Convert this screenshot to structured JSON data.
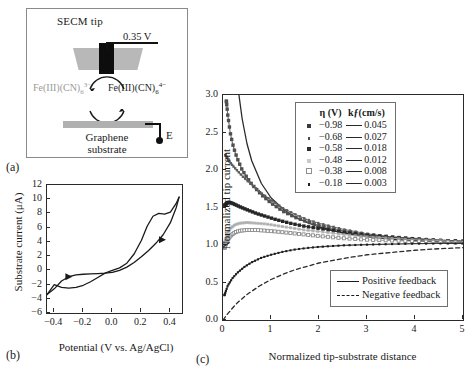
{
  "figure": {
    "panels": [
      {
        "id": "a",
        "label": "(a)"
      },
      {
        "id": "b",
        "label": "(b)"
      },
      {
        "id": "c",
        "label": "(c)"
      }
    ]
  },
  "panel_a": {
    "label": "(a)",
    "tip_title": "SECM tip",
    "tip_potential": "0.35 V",
    "species_left_main": "Fe(III)(CN)",
    "species_left_sub": "6",
    "species_left_sup": "3−",
    "species_right_main": "Fe(III)(CN)",
    "species_right_sub": "6",
    "species_right_sup": "4−",
    "electrode_label": "E",
    "substrate_line1": "Graphene",
    "substrate_line2": "substrate",
    "colors": {
      "tip_body": "#b8b8b8",
      "electrode": "#0d0d0d",
      "substrate": "#b0b0b0",
      "species_left_text": "#9a9a9a"
    }
  },
  "chart_data": [
    {
      "type": "line",
      "panel": "b",
      "title": "",
      "xlabel": "Potential (V vs. Ag/AgCl)",
      "ylabel": "Substrate current (μA)",
      "xlim": [
        -0.45,
        0.48
      ],
      "ylim": [
        -6,
        12
      ],
      "xticks": [
        -0.4,
        -0.2,
        0.0,
        0.2,
        0.4
      ],
      "xticklabels": [
        "−0.4",
        "−0.2",
        "0.0",
        "0.2",
        "0.4"
      ],
      "yticks": [
        -6,
        -4,
        -2,
        0,
        2,
        4,
        6,
        8,
        10,
        12
      ],
      "yticklabels": [
        "−6",
        "−4",
        "−2",
        "0",
        "2",
        "4",
        "6",
        "8",
        "10",
        "12"
      ],
      "grid": false,
      "legend": "none",
      "series": [
        {
          "name": "forward-scan",
          "x": [
            -0.45,
            -0.4,
            -0.35,
            -0.3,
            -0.25,
            -0.2,
            -0.15,
            -0.1,
            -0.05,
            0.0,
            0.05,
            0.1,
            0.15,
            0.2,
            0.25,
            0.3,
            0.35,
            0.4,
            0.44,
            0.46
          ],
          "y": [
            -3.4,
            -2.6,
            -1.5,
            -0.9,
            -0.65,
            -0.55,
            -0.5,
            -0.45,
            -0.4,
            -0.3,
            0.0,
            0.45,
            1.1,
            1.9,
            2.8,
            3.8,
            5.0,
            6.7,
            8.8,
            10.3
          ]
        },
        {
          "name": "reverse-scan",
          "x": [
            0.46,
            0.44,
            0.4,
            0.36,
            0.32,
            0.28,
            0.24,
            0.2,
            0.15,
            0.1,
            0.05,
            0.0,
            -0.05,
            -0.1,
            -0.15,
            -0.2,
            -0.25,
            -0.3,
            -0.35,
            -0.4,
            -0.45
          ],
          "y": [
            10.3,
            9.4,
            8.2,
            7.9,
            8.0,
            7.6,
            6.2,
            4.2,
            2.3,
            1.0,
            0.35,
            0.0,
            -0.4,
            -1.0,
            -1.6,
            -2.1,
            -2.4,
            -2.5,
            -2.4,
            -2.0,
            -3.4
          ]
        }
      ],
      "arrow_markers": [
        {
          "x": -0.3,
          "y": -0.9,
          "dir": "right"
        },
        {
          "x": 0.345,
          "y": 4.3,
          "dir": "right"
        }
      ]
    },
    {
      "type": "line",
      "panel": "c",
      "title": "",
      "xlabel": "Normalized tip-substrate distance",
      "ylabel": "Normalized tip current",
      "xlim": [
        0,
        5
      ],
      "ylim": [
        0.0,
        3.0
      ],
      "xticks": [
        0,
        1,
        2,
        3,
        4,
        5
      ],
      "xticklabels": [
        "0",
        "1",
        "2",
        "3",
        "4",
        "5"
      ],
      "yticks": [
        0.0,
        0.5,
        1.0,
        1.5,
        2.0,
        2.5,
        3.0
      ],
      "yticklabels": [
        "0.0",
        "0.5",
        "1.0",
        "1.5",
        "2.0",
        "2.5",
        "3.0"
      ],
      "grid": false,
      "legend": "inside-top-right",
      "legend_header": {
        "eta": "η (V)",
        "kf": "kƒ(cm/s)"
      },
      "legend_entries": [
        {
          "eta": "−0.98",
          "kf": "0.045",
          "marker": "filled-square-large",
          "color": "#3a3a3a",
          "size": 4.2
        },
        {
          "eta": "−0.68",
          "kf": "0.027",
          "marker": "filled-square-small",
          "color": "#4a4a4a",
          "size": 2.6
        },
        {
          "eta": "−0.58",
          "kf": "0.018",
          "marker": "filled-square-large",
          "color": "#2b2b2b",
          "size": 4.0
        },
        {
          "eta": "−0.48",
          "kf": "0.012",
          "marker": "faint-square",
          "color": "#b4b4b4",
          "size": 3.2
        },
        {
          "eta": "−0.38",
          "kf": "0.008",
          "marker": "open-square",
          "color": "#8f8f8f",
          "size": 4.0
        },
        {
          "eta": "−0.18",
          "kf": "0.003",
          "marker": "filled-square-tiny",
          "color": "#1f1f1f",
          "size": 2.4
        }
      ],
      "feedback_legend": [
        {
          "label": "Positive feedback",
          "style": "solid"
        },
        {
          "label": "Negative feedback",
          "style": "dashed"
        }
      ],
      "series": [
        {
          "name": "positive-feedback-limit",
          "style": "solid",
          "color": "#2a2a2a",
          "width": 1.3,
          "x": [
            0.05,
            0.1,
            0.15,
            0.2,
            0.3,
            0.4,
            0.5,
            0.6,
            0.8,
            1.0,
            1.25,
            1.5,
            1.75,
            2.0,
            2.5,
            3.0,
            3.5,
            4.0,
            4.5,
            5.0
          ],
          "y": [
            8.6,
            6.2,
            4.9,
            4.1,
            3.15,
            2.68,
            2.35,
            2.12,
            1.82,
            1.63,
            1.48,
            1.37,
            1.3,
            1.24,
            1.16,
            1.11,
            1.08,
            1.06,
            1.04,
            1.03
          ]
        },
        {
          "name": "negative-feedback-limit",
          "style": "dashed",
          "color": "#2a2a2a",
          "width": 1.3,
          "x": [
            0.0,
            0.1,
            0.2,
            0.3,
            0.5,
            0.75,
            1.0,
            1.25,
            1.5,
            2.0,
            2.5,
            3.0,
            3.5,
            4.0,
            4.5,
            5.0
          ],
          "y": [
            0.0,
            0.085,
            0.16,
            0.23,
            0.34,
            0.45,
            0.54,
            0.61,
            0.67,
            0.76,
            0.82,
            0.87,
            0.9,
            0.93,
            0.95,
            0.965
          ]
        },
        {
          "name": "kf-0.045",
          "eta": "−0.98",
          "kf": 0.045,
          "color": "#4f4f4f",
          "marker": "filled-square-large",
          "x": [
            0.07,
            0.1,
            0.15,
            0.2,
            0.25,
            0.3,
            0.4,
            0.5,
            0.6,
            0.8,
            1.0,
            1.25,
            1.5,
            1.75,
            2.0,
            2.5,
            3.0,
            3.5,
            4.0,
            4.5,
            5.0
          ],
          "y": [
            2.92,
            2.73,
            2.5,
            2.35,
            2.24,
            2.15,
            2.0,
            1.9,
            1.81,
            1.67,
            1.56,
            1.45,
            1.37,
            1.31,
            1.26,
            1.19,
            1.14,
            1.11,
            1.08,
            1.06,
            1.05
          ]
        },
        {
          "name": "kf-0.027",
          "eta": "−0.68",
          "kf": 0.027,
          "color": "#5c5c5c",
          "marker": "filled-square-small",
          "x": [
            0.05,
            0.1,
            0.15,
            0.2,
            0.3,
            0.4,
            0.5,
            0.6,
            0.8,
            1.0,
            1.25,
            1.5,
            1.75,
            2.0,
            2.5,
            3.0,
            3.5,
            4.0,
            4.5,
            5.0
          ],
          "y": [
            2.2,
            2.15,
            2.1,
            2.06,
            1.99,
            1.92,
            1.86,
            1.8,
            1.69,
            1.6,
            1.49,
            1.41,
            1.34,
            1.29,
            1.21,
            1.15,
            1.11,
            1.09,
            1.07,
            1.05
          ]
        },
        {
          "name": "kf-0.018",
          "eta": "−0.58",
          "kf": 0.018,
          "color": "#262626",
          "marker": "filled-square-large",
          "x": [
            0.04,
            0.08,
            0.12,
            0.18,
            0.25,
            0.35,
            0.5,
            0.7,
            0.9,
            1.1,
            1.4,
            1.7,
            2.0,
            2.5,
            3.0,
            3.5,
            4.0,
            4.5,
            5.0
          ],
          "y": [
            1.53,
            1.56,
            1.57,
            1.56,
            1.54,
            1.51,
            1.47,
            1.42,
            1.38,
            1.34,
            1.29,
            1.25,
            1.22,
            1.17,
            1.13,
            1.1,
            1.08,
            1.06,
            1.05
          ]
        },
        {
          "name": "kf-0.012",
          "eta": "−0.48",
          "kf": 0.012,
          "color": "#a8a8a8",
          "marker": "faint-square",
          "x": [
            0.03,
            0.08,
            0.15,
            0.25,
            0.35,
            0.5,
            0.7,
            0.9,
            1.1,
            1.4,
            1.7,
            2.0,
            2.5,
            3.0,
            3.5,
            4.0,
            4.5,
            5.0
          ],
          "y": [
            1.02,
            1.14,
            1.22,
            1.27,
            1.29,
            1.3,
            1.29,
            1.28,
            1.26,
            1.23,
            1.2,
            1.18,
            1.14,
            1.11,
            1.09,
            1.07,
            1.06,
            1.04
          ]
        },
        {
          "name": "kf-0.008",
          "eta": "−0.38",
          "kf": 0.008,
          "color": "#8b8b8b",
          "marker": "open-square",
          "x": [
            0.03,
            0.08,
            0.15,
            0.25,
            0.35,
            0.5,
            0.7,
            0.9,
            1.1,
            1.4,
            1.7,
            2.0,
            2.5,
            3.0,
            3.5,
            4.0,
            4.5,
            5.0
          ],
          "y": [
            0.96,
            1.05,
            1.12,
            1.17,
            1.19,
            1.2,
            1.2,
            1.19,
            1.18,
            1.16,
            1.14,
            1.12,
            1.09,
            1.07,
            1.06,
            1.05,
            1.04,
            1.03
          ]
        },
        {
          "name": "kf-0.003",
          "eta": "−0.18",
          "kf": 0.003,
          "color": "#1c1c1c",
          "marker": "filled-square-tiny",
          "x": [
            0.03,
            0.1,
            0.2,
            0.3,
            0.45,
            0.6,
            0.8,
            1.0,
            1.25,
            1.5,
            1.75,
            2.0,
            2.5,
            3.0,
            3.5,
            4.0,
            4.5,
            5.0
          ],
          "y": [
            0.33,
            0.46,
            0.56,
            0.63,
            0.71,
            0.77,
            0.83,
            0.87,
            0.91,
            0.94,
            0.96,
            0.975,
            0.995,
            1.005,
            1.012,
            1.018,
            1.02,
            1.022
          ]
        }
      ]
    }
  ]
}
